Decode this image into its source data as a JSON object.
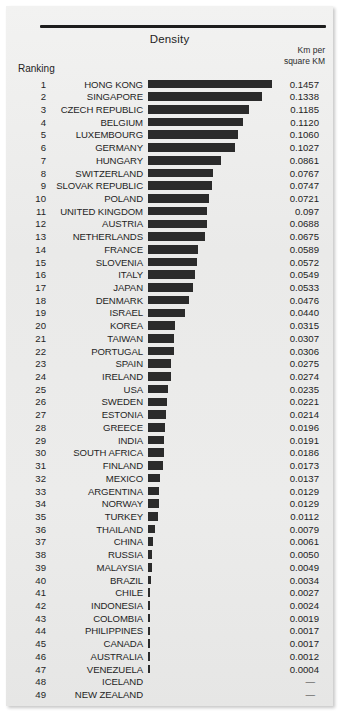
{
  "header": {
    "title": "Density",
    "unit_line1": "Km per",
    "unit_line2": "square KM",
    "ranking_label": "Ranking"
  },
  "chart_data": {
    "type": "bar",
    "title": "Density",
    "xlabel": "",
    "ylabel": "Km per square KM",
    "orientation": "horizontal",
    "grid": false,
    "legend": null,
    "xlim": [
      0,
      0.1457
    ],
    "categories": [
      "HONG KONG",
      "SINGAPORE",
      "CZECH REPUBLIC",
      "BELGIUM",
      "LUXEMBOURG",
      "GERMANY",
      "HUNGARY",
      "SWITZERLAND",
      "SLOVAK REPUBLIC",
      "POLAND",
      "UNITED KINGDOM",
      "AUSTRIA",
      "NETHERLANDS",
      "FRANCE",
      "SLOVENIA",
      "ITALY",
      "JAPAN",
      "DENMARK",
      "ISRAEL",
      "KOREA",
      "TAIWAN",
      "PORTUGAL",
      "SPAIN",
      "IRELAND",
      "USA",
      "SWEDEN",
      "ESTONIA",
      "GREECE",
      "INDIA",
      "SOUTH AFRICA",
      "FINLAND",
      "MEXICO",
      "ARGENTINA",
      "NORWAY",
      "TURKEY",
      "THAILAND",
      "CHINA",
      "RUSSIA",
      "MALAYSIA",
      "BRAZIL",
      "CHILE",
      "INDONESIA",
      "COLOMBIA",
      "PHILIPPINES",
      "CANADA",
      "AUSTRALIA",
      "VENEZUELA",
      "ICELAND",
      "NEW ZEALAND"
    ],
    "values": [
      0.1457,
      0.1338,
      0.1185,
      0.112,
      0.106,
      0.1027,
      0.0861,
      0.0767,
      0.0747,
      0.0721,
      0.0688,
      0.0688,
      0.0675,
      0.0589,
      0.0572,
      0.0549,
      0.0533,
      0.0476,
      0.044,
      0.0315,
      0.0307,
      0.0306,
      0.0275,
      0.0274,
      0.0235,
      0.0221,
      0.0214,
      0.0196,
      0.0191,
      0.0186,
      0.0173,
      0.0137,
      0.0129,
      0.0129,
      0.0112,
      0.0079,
      0.0061,
      0.005,
      0.0049,
      0.0034,
      0.0027,
      0.0024,
      0.0019,
      0.0017,
      0.0017,
      0.0012,
      0.0004,
      null,
      null
    ],
    "value_labels": [
      "0.1457",
      "0.1338",
      "0.1185",
      "0.1120",
      "0.1060",
      "0.1027",
      "0.0861",
      "0.0767",
      "0.0747",
      "0.0721",
      "0.097",
      "0.0688",
      "0.0675",
      "0.0589",
      "0.0572",
      "0.0549",
      "0.0533",
      "0.0476",
      "0.0440",
      "0.0315",
      "0.0307",
      "0.0306",
      "0.0275",
      "0.0274",
      "0.0235",
      "0.0221",
      "0.0214",
      "0.0196",
      "0.0191",
      "0.0186",
      "0.0173",
      "0.0137",
      "0.0129",
      "0.0129",
      "0.0112",
      "0.0079",
      "0.0061",
      "0.0050",
      "0.0049",
      "0.0034",
      "0.0027",
      "0.0024",
      "0.0019",
      "0.0017",
      "0.0017",
      "0.0012",
      "0.0004",
      "—",
      "—"
    ],
    "ranks": [
      "1",
      "2",
      "3",
      "4",
      "5",
      "6",
      "7",
      "8",
      "9",
      "10",
      "11",
      "12",
      "13",
      "14",
      "15",
      "16",
      "17",
      "18",
      "19",
      "20",
      "21",
      "22",
      "23",
      "24",
      "25",
      "26",
      "27",
      "28",
      "29",
      "30",
      "31",
      "32",
      "33",
      "34",
      "35",
      "36",
      "37",
      "38",
      "39",
      "40",
      "41",
      "42",
      "43",
      "44",
      "45",
      "46",
      "47",
      "48",
      "49"
    ]
  },
  "colors": {
    "bar": "#2b2b2b",
    "paper": "#ececeb",
    "rule": "#1d1d1d",
    "text": "#232323"
  }
}
